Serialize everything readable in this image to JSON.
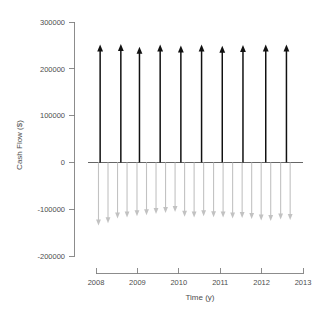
{
  "chart_data": {
    "type": "line",
    "title": "",
    "xlabel": "Time (y)",
    "ylabel": "Cash Flow ($)",
    "xlim": [
      2008,
      2013
    ],
    "ylim": [
      -200000,
      300000
    ],
    "grid": false,
    "legend": null,
    "xticks": [
      2008,
      2009,
      2010,
      2011,
      2012,
      2013
    ],
    "xticklabels": [
      "2008",
      "2009",
      "2010",
      "2011",
      "2012",
      "2013"
    ],
    "yticks": [
      -200000,
      -100000,
      0,
      100000,
      200000,
      300000
    ],
    "yticklabels": [
      "-200000",
      "-100000",
      "0",
      "100000",
      "200000",
      "300000"
    ],
    "series": [
      {
        "name": "Cash Inflows",
        "color": "#111111",
        "direction": "up",
        "x": [
          2008.1,
          2008.6,
          2009.05,
          2009.55,
          2010.05,
          2010.55,
          2011.05,
          2011.55,
          2012.1,
          2012.6
        ],
        "values": [
          252000,
          253000,
          247000,
          252000,
          250000,
          252000,
          249000,
          251000,
          252000,
          252000
        ]
      },
      {
        "name": "Cash Outflows",
        "color": "#c2c2c2",
        "direction": "down",
        "x": [
          2008.06,
          2008.29,
          2008.52,
          2008.75,
          2008.99,
          2009.22,
          2009.45,
          2009.68,
          2009.91,
          2010.14,
          2010.37,
          2010.6,
          2010.84,
          2011.07,
          2011.3,
          2011.53,
          2011.76,
          2011.99,
          2012.22,
          2012.46,
          2012.69
        ],
        "values": [
          -135000,
          -130000,
          -120000,
          -118000,
          -115000,
          -113000,
          -110000,
          -108000,
          -106000,
          -116000,
          -118000,
          -115000,
          -117000,
          -118000,
          -120000,
          -119000,
          -121000,
          -124000,
          -125000,
          -122000,
          -123000
        ]
      }
    ]
  }
}
